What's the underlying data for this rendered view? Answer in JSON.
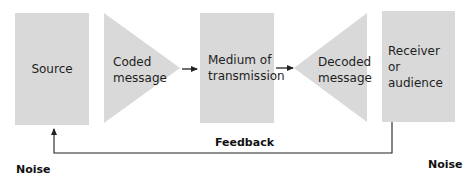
{
  "diagram": {
    "type": "communication-process",
    "nodes": [
      {
        "id": "source",
        "label": "Source",
        "shape": "rectangle"
      },
      {
        "id": "coded",
        "label_line1": "Coded",
        "label_line2": "message",
        "shape": "triangle-right"
      },
      {
        "id": "medium",
        "label_line1": "Medium of",
        "label_line2": "transmission",
        "shape": "rectangle"
      },
      {
        "id": "decoded",
        "label_line1": "Decoded",
        "label_line2": "message",
        "shape": "triangle-left"
      },
      {
        "id": "receiver",
        "label_line1": "Receiver or",
        "label_line2": "audience",
        "shape": "rectangle"
      }
    ],
    "edges": [
      {
        "from": "coded",
        "to": "medium"
      },
      {
        "from": "medium",
        "to": "decoded"
      },
      {
        "from": "receiver",
        "to": "source",
        "label": "Feedback"
      }
    ],
    "feedback_label": "Feedback",
    "noise_left": "Noise",
    "noise_right": "Noise",
    "colors": {
      "shape_fill": "#d9d9d9",
      "line": "#222222",
      "text": "#1e1e1e"
    }
  }
}
